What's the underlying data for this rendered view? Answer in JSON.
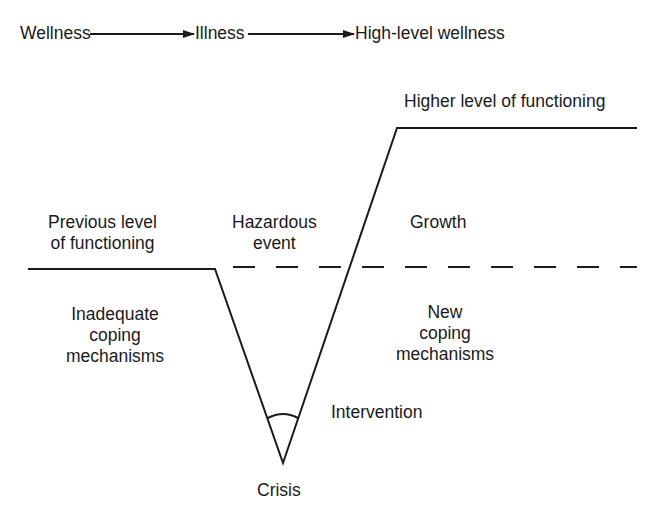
{
  "flow": {
    "steps": [
      "Wellness",
      "Illness",
      "High-level wellness"
    ]
  },
  "labels": {
    "higher_level": "Higher level of functioning",
    "previous_level_line1": "Previous level",
    "previous_level_line2": "of functioning",
    "hazardous_line1": "Hazardous",
    "hazardous_line2": "event",
    "growth": "Growth",
    "inadequate_line1": "Inadequate",
    "inadequate_line2": "coping",
    "inadequate_line3": "mechanisms",
    "new_line1": "New",
    "new_line2": "coping",
    "new_line3": "mechanisms",
    "intervention": "Intervention",
    "crisis": "Crisis"
  },
  "colors": {
    "line": "#1a1a1a",
    "background": "#ffffff"
  }
}
